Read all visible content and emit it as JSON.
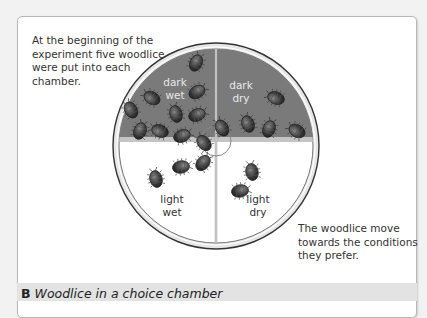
{
  "figure": {
    "label": "B",
    "caption": "Woodlice in a choice chamber"
  },
  "annotations": {
    "top_left": "At the beginning of the experiment five woodlice were put into each chamber.",
    "bottom_right": "The woodlice move towards the conditions they prefer."
  },
  "chamber": {
    "quadrants": [
      {
        "id": "dark-wet",
        "line1": "dark",
        "line2": "wet",
        "woodlice_count": 10,
        "shade": "dark"
      },
      {
        "id": "dark-dry",
        "line1": "dark",
        "line2": "dry",
        "woodlice_count": 6,
        "shade": "dark"
      },
      {
        "id": "light-wet",
        "line1": "light",
        "line2": "wet",
        "woodlice_count": 3,
        "shade": "light"
      },
      {
        "id": "light-dry",
        "line1": "light",
        "line2": "dry",
        "woodlice_count": 2,
        "shade": "light"
      }
    ]
  },
  "colors": {
    "dark_region": "#7a7a7a",
    "light_region": "#ffffff",
    "woodlouse": "#3a3a3a",
    "rim": "#d6d6d6",
    "caption_bar": "#e3e3e3"
  }
}
